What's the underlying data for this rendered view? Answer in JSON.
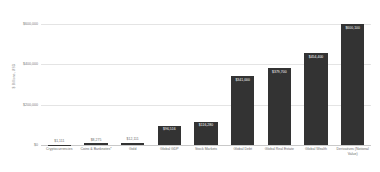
{
  "chart_data": {
    "type": "bar",
    "title": "",
    "xlabel": "",
    "ylabel": "$ Billions, USD",
    "ylim": [
      0,
      650000
    ],
    "grid": true,
    "legend": "none",
    "yticks": [
      "$0",
      "$200,000",
      "$400,000",
      "$600,000"
    ],
    "ytick_values": [
      0,
      200000,
      400000,
      600000
    ],
    "categories": [
      "Cryptocurrencies",
      "Coins & Banknotes*",
      "Gold",
      "Global GDP",
      "Stock Markets",
      "Global Debt",
      "Global Real Estate",
      "Global Wealth",
      "Derivatives (Notional Value)"
    ],
    "values": [
      1111,
      8275,
      12111,
      96516,
      116280,
      341000,
      379700,
      454400,
      600100
    ],
    "value_labels": [
      "$1,111",
      "$8,275",
      "$12,111",
      "$96,516",
      "$116,280",
      "$341,000",
      "$379,700",
      "$454,400",
      "$600,100"
    ],
    "label_inside": [
      false,
      false,
      false,
      true,
      true,
      true,
      true,
      true,
      true
    ],
    "bar_color": "#333333",
    "grid_color": "#e4e4e4",
    "axis_color": "#c9c9c9",
    "text_color": "#6b6b6b"
  }
}
